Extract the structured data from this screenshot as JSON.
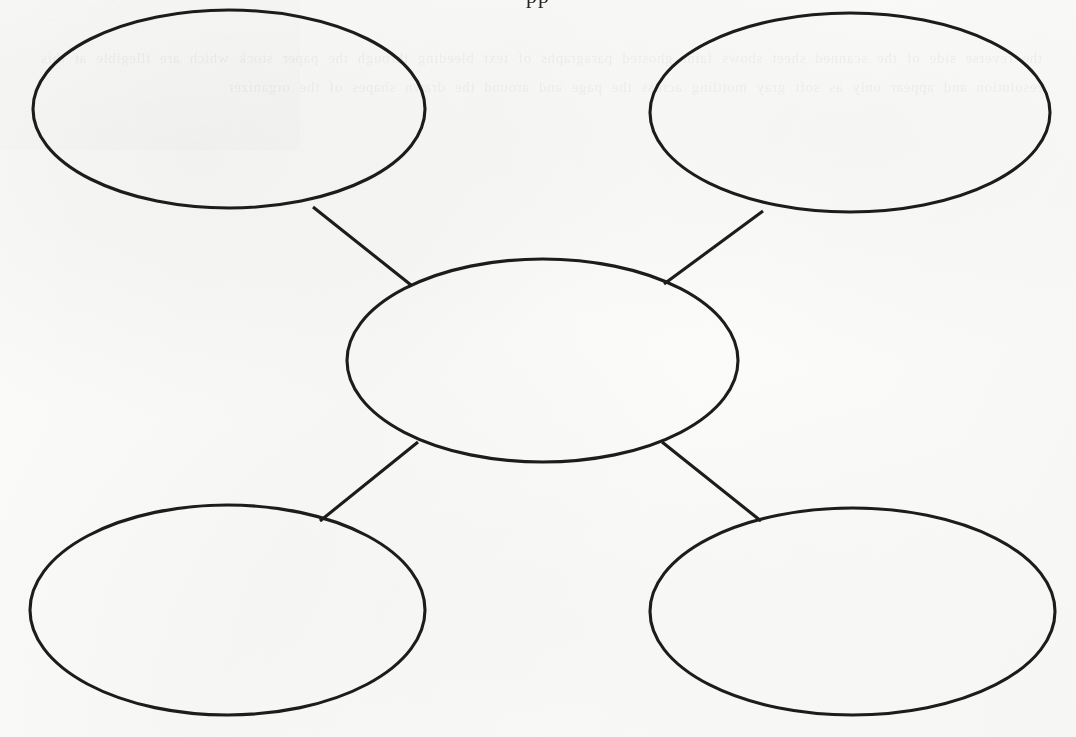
{
  "document": {
    "kind": "graphic-organizer-worksheet",
    "name": "Bubble Map",
    "page_background_hex": "#fafaf9",
    "ink_color_hex": "#1c1c1c",
    "clipped_header_text": "pp",
    "bleed_through_text": "the reverse side of the scanned sheet shows faint ghosted paragraphs of text bleeding through the paper stock which are illegible at this resolution and appear only as soft gray mottling across the page and around the drawn shapes of the organizer",
    "width_px": 1076,
    "height_px": 737
  },
  "diagram": {
    "type": "bubble-map",
    "center": {
      "id": "center-bubble",
      "label": "",
      "cx": 542.5,
      "cy": 360.5,
      "rx": 195.5,
      "ry": 101.5
    },
    "nodes": [
      {
        "id": "bubble-top-left",
        "label": "",
        "cx": 229.0,
        "cy": 109.0,
        "rx": 196.0,
        "ry": 99.0
      },
      {
        "id": "bubble-top-right",
        "label": "",
        "cx": 850.0,
        "cy": 112.5,
        "rx": 200.0,
        "ry": 99.5
      },
      {
        "id": "bubble-bottom-left",
        "label": "",
        "cx": 227.5,
        "cy": 610.0,
        "rx": 197.5,
        "ry": 105.0
      },
      {
        "id": "bubble-bottom-right",
        "label": "",
        "cx": 852.5,
        "cy": 611.5,
        "rx": 202.5,
        "ry": 103.5
      }
    ],
    "edges": [
      {
        "id": "edge-center-top-left",
        "from": "bubble-top-left",
        "to": "center-bubble",
        "x1": 313,
        "y1": 207,
        "x2": 411,
        "y2": 285
      },
      {
        "id": "edge-center-top-right",
        "from": "bubble-top-right",
        "to": "center-bubble",
        "x1": 763,
        "y1": 211,
        "x2": 664,
        "y2": 284
      },
      {
        "id": "edge-center-bottom-left",
        "from": "center-bubble",
        "to": "bubble-bottom-left",
        "x1": 418,
        "y1": 442,
        "x2": 320,
        "y2": 521
      },
      {
        "id": "edge-center-bottom-right",
        "from": "center-bubble",
        "to": "bubble-bottom-right",
        "x1": 662,
        "y1": 442,
        "x2": 761,
        "y2": 521
      }
    ]
  }
}
